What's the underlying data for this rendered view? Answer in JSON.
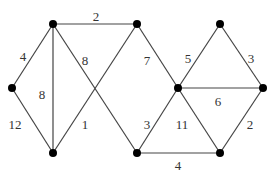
{
  "graph": {
    "nodes": [
      {
        "id": "A",
        "x": 12,
        "y": 88
      },
      {
        "id": "B",
        "x": 53,
        "y": 24
      },
      {
        "id": "C",
        "x": 137,
        "y": 24
      },
      {
        "id": "D",
        "x": 53,
        "y": 153
      },
      {
        "id": "E",
        "x": 137,
        "y": 153
      },
      {
        "id": "F",
        "x": 178,
        "y": 88
      },
      {
        "id": "G",
        "x": 220,
        "y": 24
      },
      {
        "id": "H",
        "x": 263,
        "y": 88
      },
      {
        "id": "I",
        "x": 220,
        "y": 153
      }
    ],
    "edges": [
      {
        "from": "A",
        "to": "B",
        "weight": "4",
        "lx": 23,
        "ly": 58
      },
      {
        "from": "B",
        "to": "C",
        "weight": "2",
        "lx": 96,
        "ly": 18
      },
      {
        "from": "A",
        "to": "D",
        "weight": "12",
        "lx": 15,
        "ly": 126
      },
      {
        "from": "B",
        "to": "D",
        "weight": "8",
        "lx": 42,
        "ly": 96
      },
      {
        "from": "B",
        "to": "E",
        "weight": "8",
        "lx": 85,
        "ly": 62
      },
      {
        "from": "D",
        "to": "C",
        "weight": "1",
        "lx": 85,
        "ly": 126
      },
      {
        "from": "C",
        "to": "F",
        "weight": "7",
        "lx": 147,
        "ly": 62
      },
      {
        "from": "E",
        "to": "F",
        "weight": "3",
        "lx": 147,
        "ly": 126
      },
      {
        "from": "F",
        "to": "G",
        "weight": "5",
        "lx": 188,
        "ly": 60
      },
      {
        "from": "G",
        "to": "H",
        "weight": "3",
        "lx": 251,
        "ly": 60
      },
      {
        "from": "F",
        "to": "H",
        "weight": "6",
        "lx": 218,
        "ly": 103
      },
      {
        "from": "F",
        "to": "I",
        "weight": "11",
        "lx": 182,
        "ly": 126
      },
      {
        "from": "H",
        "to": "I",
        "weight": "2",
        "lx": 250,
        "ly": 126
      },
      {
        "from": "E",
        "to": "I",
        "weight": "4",
        "lx": 178,
        "ly": 167
      }
    ]
  }
}
